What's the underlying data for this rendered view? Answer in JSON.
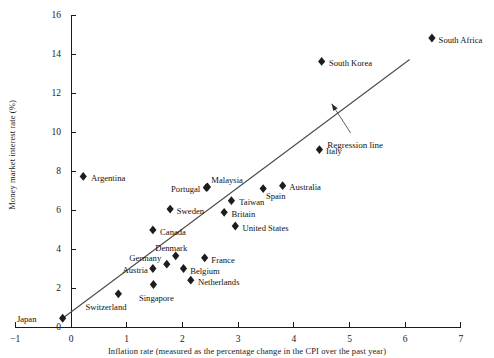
{
  "chart_data": {
    "type": "scatter",
    "title": "",
    "xlabel": "Inflation rate (measured as the percentage change in the CPI over the past year)",
    "ylabel": "Money market interest rate (%)",
    "xlim": [
      -1,
      7
    ],
    "ylim": [
      0,
      16
    ],
    "xticks": [
      -1,
      0,
      1,
      2,
      3,
      4,
      5,
      6,
      7
    ],
    "yticks": [
      0,
      2,
      4,
      6,
      8,
      10,
      12,
      14,
      16
    ],
    "xtick_labels": [
      "−1",
      "0",
      "1",
      "2",
      "3",
      "4",
      "5",
      "6",
      "7"
    ],
    "ytick_labels": [
      "0",
      "2",
      "4",
      "6",
      "8",
      "10",
      "12",
      "14",
      "16"
    ],
    "grid": false,
    "legend": "none",
    "marker": "diamond",
    "points": [
      {
        "label": "Japan",
        "x": -0.15,
        "y": 0.45,
        "lx": -0.62,
        "ly": 0.4,
        "anchor": "end"
      },
      {
        "label": "Switzerland",
        "x": 0.85,
        "y": 1.7,
        "lx": 0.26,
        "ly": 1.02,
        "anchor": "start"
      },
      {
        "label": "Singapore",
        "x": 1.48,
        "y": 2.18,
        "lx": 1.22,
        "ly": 1.48,
        "anchor": "start"
      },
      {
        "label": "Netherlands",
        "x": 2.15,
        "y": 2.4,
        "lx": 2.28,
        "ly": 2.3,
        "anchor": "start"
      },
      {
        "label": "Austria",
        "x": 1.47,
        "y": 3.0,
        "lx": 1.38,
        "ly": 2.92,
        "anchor": "end"
      },
      {
        "label": "Belgium",
        "x": 2.02,
        "y": 3.0,
        "lx": 2.14,
        "ly": 2.9,
        "anchor": "start"
      },
      {
        "label": "Germany",
        "x": 1.72,
        "y": 3.22,
        "lx": 1.62,
        "ly": 3.52,
        "anchor": "end"
      },
      {
        "label": "Denmark",
        "x": 1.88,
        "y": 3.65,
        "lx": 1.8,
        "ly": 4.08,
        "anchor": "middle"
      },
      {
        "label": "France",
        "x": 2.4,
        "y": 3.55,
        "lx": 2.52,
        "ly": 3.45,
        "anchor": "start"
      },
      {
        "label": "Canada",
        "x": 1.47,
        "y": 4.98,
        "lx": 1.6,
        "ly": 4.9,
        "anchor": "start"
      },
      {
        "label": "United States",
        "x": 2.95,
        "y": 5.18,
        "lx": 3.08,
        "ly": 5.08,
        "anchor": "start"
      },
      {
        "label": "Britain",
        "x": 2.75,
        "y": 5.88,
        "lx": 2.88,
        "ly": 5.8,
        "anchor": "start"
      },
      {
        "label": "Sweden",
        "x": 1.78,
        "y": 6.05,
        "lx": 1.9,
        "ly": 5.97,
        "anchor": "start"
      },
      {
        "label": "Taiwan",
        "x": 2.88,
        "y": 6.48,
        "lx": 3.02,
        "ly": 6.4,
        "anchor": "start"
      },
      {
        "label": "Spain",
        "x": 3.45,
        "y": 7.1,
        "lx": 3.5,
        "ly": 6.7,
        "anchor": "start"
      },
      {
        "label": "Portugal",
        "x": 2.43,
        "y": 7.15,
        "lx": 2.32,
        "ly": 7.06,
        "anchor": "end"
      },
      {
        "label": "Malaysia",
        "x": 2.45,
        "y": 7.18,
        "lx": 2.52,
        "ly": 7.55,
        "anchor": "start"
      },
      {
        "label": "Australia",
        "x": 3.8,
        "y": 7.25,
        "lx": 3.92,
        "ly": 7.18,
        "anchor": "start"
      },
      {
        "label": "Argentina",
        "x": 0.22,
        "y": 7.72,
        "lx": 0.36,
        "ly": 7.64,
        "anchor": "start"
      },
      {
        "label": "Italy",
        "x": 4.46,
        "y": 9.1,
        "lx": 4.58,
        "ly": 9.02,
        "anchor": "start"
      },
      {
        "label": "South Korea",
        "x": 4.5,
        "y": 13.62,
        "lx": 4.63,
        "ly": 13.54,
        "anchor": "start"
      },
      {
        "label": "South Africa",
        "x": 6.48,
        "y": 14.82,
        "lx": 6.6,
        "ly": 14.74,
        "anchor": "start"
      }
    ],
    "regression_line": {
      "label": "Regression line",
      "x1": -0.15,
      "y1": 0.45,
      "x2": 6.08,
      "y2": 13.72
    },
    "annotation": {
      "text": "Regression line",
      "text_x": 5.1,
      "text_y": 9.35,
      "arrow_from_x": 5.02,
      "arrow_from_y": 9.95,
      "arrow_to_x": 4.68,
      "arrow_to_y": 11.45
    }
  }
}
